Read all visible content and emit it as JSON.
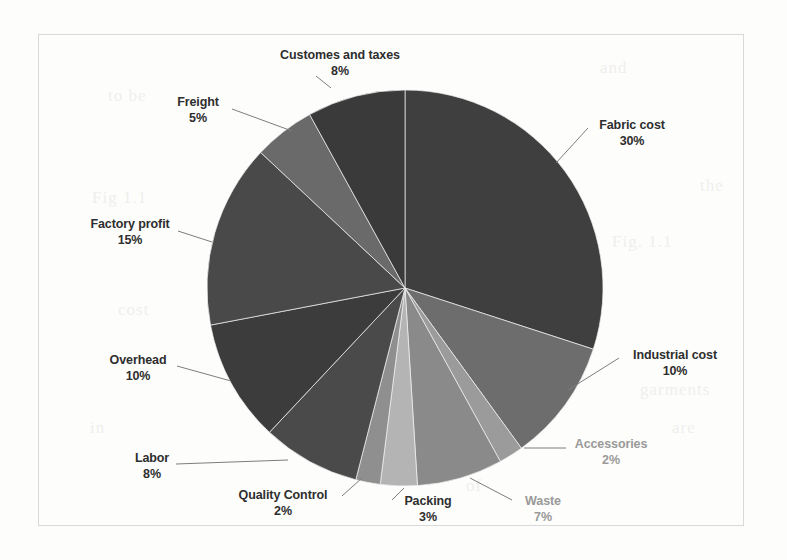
{
  "chart_data": {
    "type": "pie",
    "title": "",
    "subtitle": "",
    "xlabel": "",
    "ylabel": "",
    "legend_position": "none",
    "grid": false,
    "label_format": "name + percent",
    "start_angle_deg": 0,
    "direction": "clockwise",
    "total_percent": 100,
    "categories": [
      "Fabric cost",
      "Industrial cost",
      "Accessories",
      "Waste",
      "Packing",
      "Quality Control",
      "Labor",
      "Overhead",
      "Factory profit",
      "Freight",
      "Customes and taxes"
    ],
    "values": [
      30,
      10,
      2,
      7,
      3,
      2,
      8,
      10,
      15,
      5,
      8
    ],
    "slices": [
      {
        "label": "Fabric cost",
        "percent": 30,
        "percent_text": "30%",
        "color": "#3f3f3f",
        "label_style": "dark",
        "label_pos": "right-top"
      },
      {
        "label": "Industrial cost",
        "percent": 10,
        "percent_text": "10%",
        "color": "#6d6d6d",
        "label_style": "dark",
        "label_pos": "right-middle"
      },
      {
        "label": "Accessories",
        "percent": 2,
        "percent_text": "2%",
        "color": "#9b9b9b",
        "label_style": "faint",
        "label_pos": "right-lower"
      },
      {
        "label": "Waste",
        "percent": 7,
        "percent_text": "7%",
        "color": "#8a8a8a",
        "label_style": "faint",
        "label_pos": "bottom-right"
      },
      {
        "label": "Packing",
        "percent": 3,
        "percent_text": "3%",
        "color": "#b4b4b4",
        "label_style": "dark",
        "label_pos": "bottom-center"
      },
      {
        "label": "Quality Control",
        "percent": 2,
        "percent_text": "2%",
        "color": "#8f8f8f",
        "label_style": "dark",
        "label_pos": "bottom-left"
      },
      {
        "label": "Labor",
        "percent": 8,
        "percent_text": "8%",
        "color": "#4a4a4a",
        "label_style": "dark",
        "label_pos": "left-lower"
      },
      {
        "label": "Overhead",
        "percent": 10,
        "percent_text": "10%",
        "color": "#3c3c3c",
        "label_style": "dark",
        "label_pos": "left-middle"
      },
      {
        "label": "Factory profit",
        "percent": 15,
        "percent_text": "15%",
        "color": "#494949",
        "label_style": "dark",
        "label_pos": "left-upper"
      },
      {
        "label": "Freight",
        "percent": 5,
        "percent_text": "5%",
        "color": "#6a6a6a",
        "label_style": "dark",
        "label_pos": "top-left"
      },
      {
        "label": "Customes and taxes",
        "percent": 8,
        "percent_text": "8%",
        "color": "#3a3a3a",
        "label_style": "dark",
        "label_pos": "top-center"
      }
    ]
  },
  "labels": {
    "customs": {
      "name": "Customes and taxes",
      "pct": "8%"
    },
    "freight": {
      "name": "Freight",
      "pct": "5%"
    },
    "factory_profit": {
      "name": "Factory profit",
      "pct": "15%"
    },
    "overhead": {
      "name": "Overhead",
      "pct": "10%"
    },
    "labor": {
      "name": "Labor",
      "pct": "8%"
    },
    "quality": {
      "name": "Quality Control",
      "pct": "2%"
    },
    "packing": {
      "name": "Packing",
      "pct": "3%"
    },
    "waste": {
      "name": "Waste",
      "pct": "7%"
    },
    "accessories": {
      "name": "Accessories",
      "pct": "2%"
    },
    "industrial": {
      "name": "Industrial cost",
      "pct": "10%"
    },
    "fabric": {
      "name": "Fabric cost",
      "pct": "30%"
    }
  },
  "background_artifacts": [
    {
      "text": "to be",
      "x": 108,
      "y": 86
    },
    {
      "text": "and",
      "x": 600,
      "y": 58
    },
    {
      "text": "Fig 1.1",
      "x": 92,
      "y": 188
    },
    {
      "text": "the",
      "x": 700,
      "y": 176
    },
    {
      "text": "cost",
      "x": 118,
      "y": 300
    },
    {
      "text": "Fig. 1.1",
      "x": 612,
      "y": 232
    },
    {
      "text": "in",
      "x": 90,
      "y": 418
    },
    {
      "text": "garments",
      "x": 640,
      "y": 380
    },
    {
      "text": "are",
      "x": 672,
      "y": 418
    },
    {
      "text": "of",
      "x": 466,
      "y": 476
    },
    {
      "text": "cost",
      "x": 300,
      "y": 204
    }
  ]
}
